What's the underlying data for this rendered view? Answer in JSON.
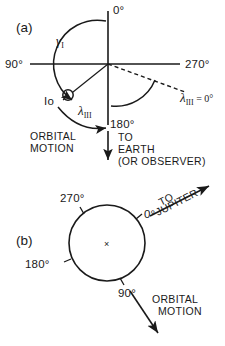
{
  "figure": {
    "background_color": "#ffffff",
    "line_color": "#1a1a1a",
    "panels": [
      {
        "id": "a",
        "label": "(a)",
        "axis_labels": {
          "top": "0°",
          "left": "90°",
          "right": "270°",
          "bottom": "180°"
        },
        "annotations": {
          "gamma": "γ",
          "gamma_subscript": "I",
          "lambda": "λ",
          "lambda_subscript": "III",
          "lambda_ref": "λ",
          "lambda_ref_subscript": "III",
          "lambda_ref_value": "= 0°",
          "io": "Io",
          "orbital_motion_line1": "ORBITAL",
          "orbital_motion_line2": "MOTION",
          "to_earth_line1": "TO",
          "to_earth_line2": "EARTH",
          "to_earth_line3": "(OR OBSERVER)"
        }
      },
      {
        "id": "b",
        "label": "(b)",
        "circle_labels": {
          "zero": "0°",
          "ninety": "90°",
          "one_eighty": "180°",
          "two_seventy": "270°"
        },
        "annotations": {
          "to_jupiter_line1": "TO",
          "to_jupiter_line2": "JUPITER",
          "orbital_motion_line1": "ORBITAL",
          "orbital_motion_line2": "MOTION",
          "center_mark": "×"
        }
      }
    ]
  }
}
